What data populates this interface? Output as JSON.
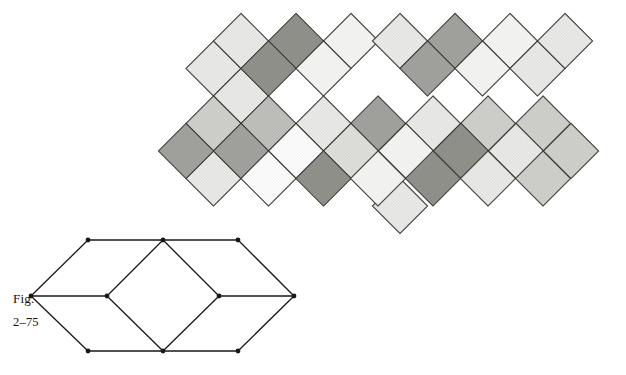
{
  "figure": {
    "label_word": "Fig.",
    "label_number": "2–75",
    "caption_full": "Fig. 2–75"
  },
  "palette": {
    "background": "#ffffff",
    "stroke": "#2a2622",
    "tone_white": "#fdfdfd",
    "tone_lightest": "#f2f2f0",
    "tone_light": "#e2e2df",
    "tone_light_mid": "#d2d2ce",
    "tone_mid": "#bdbdb8",
    "tone_mid_dark": "#a6a6a1",
    "tone_dark": "#7d7d78",
    "tone_darkest": "#66665f",
    "line_dot": "#1a1714"
  },
  "tessellation": {
    "name": "rhombic-cube-tessellation",
    "unit_half_width": 27.5,
    "unit_half_height": 27.5,
    "origin": {
      "x": 186.0,
      "y": 123.5
    },
    "description": "Interlocking rhombi forming isometric cubes alternating with rotated squares",
    "faces": [
      {
        "id": "f01",
        "cx": 213.5,
        "cy": 68.5,
        "w": 27.5,
        "h": 27.5,
        "tone": "tone_light",
        "kind": "cube-top"
      },
      {
        "id": "f02",
        "cx": 241.0,
        "cy": 96.0,
        "w": 27.5,
        "h": 27.5,
        "tone": "tone_light",
        "kind": "cube-top"
      },
      {
        "id": "f03",
        "cx": 241.0,
        "cy": 41.0,
        "w": 27.5,
        "h": 27.5,
        "tone": "tone_light",
        "kind": "cube-top"
      },
      {
        "id": "f04",
        "cx": 296.0,
        "cy": 41.0,
        "w": 27.5,
        "h": 27.5,
        "tone": "tone_darkest",
        "kind": "diamond"
      },
      {
        "id": "f05",
        "cx": 268.5,
        "cy": 68.5,
        "w": 27.5,
        "h": 27.5,
        "tone": "tone_darkest",
        "kind": "diamond"
      },
      {
        "id": "f06",
        "cx": 351.0,
        "cy": 41.0,
        "w": 27.5,
        "h": 27.5,
        "tone": "tone_lightest",
        "kind": "cube-top"
      },
      {
        "id": "f07",
        "cx": 323.5,
        "cy": 68.5,
        "w": 27.5,
        "h": 27.5,
        "tone": "tone_lightest",
        "kind": "cube-top"
      },
      {
        "id": "f08",
        "cx": 400.0,
        "cy": 41.0,
        "w": 27.5,
        "h": 27.5,
        "tone": "tone_light",
        "kind": "crown-diamond"
      },
      {
        "id": "f09",
        "cx": 455.0,
        "cy": 41.0,
        "w": 27.5,
        "h": 27.5,
        "tone": "tone_dark",
        "kind": "diamond"
      },
      {
        "id": "f10",
        "cx": 427.5,
        "cy": 68.5,
        "w": 27.5,
        "h": 27.5,
        "tone": "tone_dark",
        "kind": "diamond"
      },
      {
        "id": "f11",
        "cx": 510.0,
        "cy": 41.0,
        "w": 27.5,
        "h": 27.5,
        "tone": "tone_lightest",
        "kind": "cube-top"
      },
      {
        "id": "f12",
        "cx": 482.5,
        "cy": 68.5,
        "w": 27.5,
        "h": 27.5,
        "tone": "tone_lightest",
        "kind": "cube-top"
      },
      {
        "id": "f13",
        "cx": 537.5,
        "cy": 68.5,
        "w": 27.5,
        "h": 27.5,
        "tone": "tone_light",
        "kind": "cube-top"
      },
      {
        "id": "f14",
        "cx": 565.0,
        "cy": 41.0,
        "w": 27.5,
        "h": 27.5,
        "tone": "tone_light",
        "kind": "cube-top"
      },
      {
        "id": "f15",
        "cx": 213.5,
        "cy": 123.5,
        "w": 27.5,
        "h": 27.5,
        "tone": "tone_mid",
        "kind": "cube-left"
      },
      {
        "id": "f16",
        "cx": 268.5,
        "cy": 123.5,
        "w": 27.5,
        "h": 27.5,
        "tone": "tone_mid_dark",
        "kind": "cube-right"
      },
      {
        "id": "f17",
        "cx": 323.5,
        "cy": 123.5,
        "w": 27.5,
        "h": 27.5,
        "tone": "tone_light",
        "kind": "cube-left"
      },
      {
        "id": "f18",
        "cx": 378.0,
        "cy": 123.5,
        "w": 27.5,
        "h": 27.5,
        "tone": "tone_dark",
        "kind": "diamond"
      },
      {
        "id": "f19",
        "cx": 433.0,
        "cy": 123.5,
        "w": 27.5,
        "h": 27.5,
        "tone": "tone_light",
        "kind": "cube-left"
      },
      {
        "id": "f20",
        "cx": 488.0,
        "cy": 123.5,
        "w": 27.5,
        "h": 27.5,
        "tone": "tone_mid",
        "kind": "cube-right"
      },
      {
        "id": "f21",
        "cx": 543.0,
        "cy": 123.5,
        "w": 27.5,
        "h": 27.5,
        "tone": "tone_mid",
        "kind": "cube-right"
      },
      {
        "id": "f22",
        "cx": 213.5,
        "cy": 178.5,
        "w": 27.5,
        "h": 27.5,
        "tone": "tone_light",
        "kind": "cube-bottom"
      },
      {
        "id": "f23",
        "cx": 241.0,
        "cy": 151.0,
        "w": 27.5,
        "h": 27.5,
        "tone": "tone_dark",
        "kind": "diamond"
      },
      {
        "id": "f24",
        "cx": 186.0,
        "cy": 151.0,
        "w": 27.5,
        "h": 27.5,
        "tone": "tone_dark",
        "kind": "diamond"
      },
      {
        "id": "f25",
        "cx": 296.0,
        "cy": 151.0,
        "w": 27.5,
        "h": 27.5,
        "tone": "tone_white",
        "kind": "cube-top"
      },
      {
        "id": "f26",
        "cx": 268.5,
        "cy": 178.5,
        "w": 27.5,
        "h": 27.5,
        "tone": "tone_white",
        "kind": "cube-top"
      },
      {
        "id": "f27",
        "cx": 351.0,
        "cy": 151.0,
        "w": 27.5,
        "h": 27.5,
        "tone": "tone_light_mid",
        "kind": "cube-left"
      },
      {
        "id": "f28",
        "cx": 323.5,
        "cy": 178.5,
        "w": 27.5,
        "h": 27.5,
        "tone": "tone_darkest",
        "kind": "diamond"
      },
      {
        "id": "f29",
        "cx": 400.0,
        "cy": 206.0,
        "w": 27.5,
        "h": 27.5,
        "tone": "tone_light",
        "kind": "pendant-diamond"
      },
      {
        "id": "f30",
        "cx": 406.0,
        "cy": 151.0,
        "w": 27.5,
        "h": 27.5,
        "tone": "tone_lightest",
        "kind": "cube-top"
      },
      {
        "id": "f31",
        "cx": 378.0,
        "cy": 178.5,
        "w": 27.5,
        "h": 27.5,
        "tone": "tone_lightest",
        "kind": "cube-top"
      },
      {
        "id": "f32",
        "cx": 461.0,
        "cy": 151.0,
        "w": 27.5,
        "h": 27.5,
        "tone": "tone_darkest",
        "kind": "diamond"
      },
      {
        "id": "f33",
        "cx": 433.0,
        "cy": 178.5,
        "w": 27.5,
        "h": 27.5,
        "tone": "tone_darkest",
        "kind": "diamond"
      },
      {
        "id": "f34",
        "cx": 516.0,
        "cy": 151.0,
        "w": 27.5,
        "h": 27.5,
        "tone": "tone_light",
        "kind": "cube-left"
      },
      {
        "id": "f35",
        "cx": 488.0,
        "cy": 178.5,
        "w": 27.5,
        "h": 27.5,
        "tone": "tone_light",
        "kind": "cube-left"
      },
      {
        "id": "f36",
        "cx": 543.0,
        "cy": 178.5,
        "w": 27.5,
        "h": 27.5,
        "tone": "tone_mid",
        "kind": "cube-right"
      },
      {
        "id": "f37",
        "cx": 571.0,
        "cy": 151.0,
        "w": 27.5,
        "h": 27.5,
        "tone": "tone_mid",
        "kind": "cube-right"
      }
    ]
  },
  "line_drawing": {
    "name": "rhombus-square-rhombus-outline",
    "vertices": [
      {
        "id": "v1",
        "x": 88.0,
        "y": 240.0
      },
      {
        "id": "v2",
        "x": 163.0,
        "y": 240.0
      },
      {
        "id": "v3",
        "x": 238.0,
        "y": 240.0
      },
      {
        "id": "v4",
        "x": 31.0,
        "y": 296.0
      },
      {
        "id": "v5",
        "x": 107.0,
        "y": 296.0
      },
      {
        "id": "v6",
        "x": 219.0,
        "y": 296.0
      },
      {
        "id": "v7",
        "x": 294.0,
        "y": 296.0
      },
      {
        "id": "v8",
        "x": 88.0,
        "y": 351.0
      },
      {
        "id": "v9",
        "x": 163.0,
        "y": 351.0
      },
      {
        "id": "v10",
        "x": 238.0,
        "y": 351.0
      }
    ],
    "edges": [
      [
        "v1",
        "v2"
      ],
      [
        "v2",
        "v3"
      ],
      [
        "v1",
        "v4"
      ],
      [
        "v4",
        "v8"
      ],
      [
        "v8",
        "v9"
      ],
      [
        "v9",
        "v10"
      ],
      [
        "v3",
        "v7"
      ],
      [
        "v7",
        "v10"
      ],
      [
        "v4",
        "v5"
      ],
      [
        "v5",
        "v2"
      ],
      [
        "v2",
        "v6"
      ],
      [
        "v6",
        "v9"
      ],
      [
        "v9",
        "v5"
      ],
      [
        "v6",
        "v7"
      ]
    ],
    "dot_radius": 2.4
  }
}
